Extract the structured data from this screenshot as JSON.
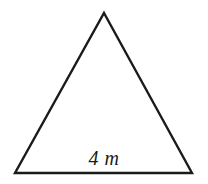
{
  "figure": {
    "kind": "geometry-diagram",
    "shape_name": "triangle",
    "background_color": "#ffffff",
    "stroke_color": "#1a1a1a",
    "stroke_width": 2.4,
    "canvas": {
      "width": 208,
      "height": 184
    },
    "vertices": {
      "apex": {
        "x": 104,
        "y": 13
      },
      "bottom_left": {
        "x": 15,
        "y": 173
      },
      "bottom_right": {
        "x": 192,
        "y": 173
      }
    },
    "polygon_points": "104,13 192,173 15,173",
    "labels": {
      "base": {
        "text": "4 m",
        "value": "4",
        "unit": "m",
        "style": "italic",
        "color": "#1a1a1a",
        "x": 104,
        "y": 158
      }
    }
  }
}
